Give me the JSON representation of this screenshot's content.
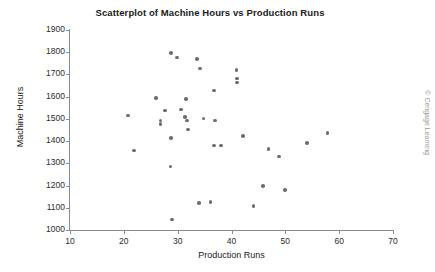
{
  "credit": "© Cengage Learning",
  "chart_data": {
    "type": "scatter",
    "title": "Scatterplot of Machine Hours vs Production Runs",
    "xlabel": "Production Runs",
    "ylabel": "Machine Hours",
    "xlim": [
      10,
      70
    ],
    "ylim": [
      1000,
      1900
    ],
    "xticks": [
      10,
      20,
      30,
      40,
      50,
      60,
      70
    ],
    "yticks": [
      1000,
      1100,
      1200,
      1300,
      1400,
      1500,
      1600,
      1700,
      1800,
      1900
    ],
    "grid": false,
    "legend": null,
    "marker_color": "#6e6e6e",
    "points": [
      {
        "x": 20.8,
        "y": 1515
      },
      {
        "x": 21.9,
        "y": 1358
      },
      {
        "x": 26.0,
        "y": 1593
      },
      {
        "x": 26.8,
        "y": 1492
      },
      {
        "x": 26.8,
        "y": 1478
      },
      {
        "x": 27.6,
        "y": 1538
      },
      {
        "x": 28.8,
        "y": 1797
      },
      {
        "x": 28.8,
        "y": 1413
      },
      {
        "x": 28.7,
        "y": 1285
      },
      {
        "x": 28.9,
        "y": 1047
      },
      {
        "x": 29.9,
        "y": 1777
      },
      {
        "x": 30.6,
        "y": 1543
      },
      {
        "x": 31.4,
        "y": 1508
      },
      {
        "x": 31.6,
        "y": 1589
      },
      {
        "x": 31.7,
        "y": 1493
      },
      {
        "x": 31.9,
        "y": 1453
      },
      {
        "x": 33.6,
        "y": 1770
      },
      {
        "x": 34.2,
        "y": 1727
      },
      {
        "x": 34.0,
        "y": 1122
      },
      {
        "x": 34.8,
        "y": 1502
      },
      {
        "x": 36.1,
        "y": 1127
      },
      {
        "x": 36.8,
        "y": 1628
      },
      {
        "x": 36.9,
        "y": 1493
      },
      {
        "x": 36.8,
        "y": 1381
      },
      {
        "x": 38.0,
        "y": 1380
      },
      {
        "x": 40.9,
        "y": 1720
      },
      {
        "x": 41.0,
        "y": 1681
      },
      {
        "x": 41.0,
        "y": 1664
      },
      {
        "x": 42.1,
        "y": 1422
      },
      {
        "x": 44.1,
        "y": 1108
      },
      {
        "x": 45.9,
        "y": 1199
      },
      {
        "x": 46.9,
        "y": 1364
      },
      {
        "x": 48.8,
        "y": 1331
      },
      {
        "x": 49.9,
        "y": 1180
      },
      {
        "x": 54.0,
        "y": 1391
      },
      {
        "x": 57.8,
        "y": 1437
      }
    ]
  }
}
